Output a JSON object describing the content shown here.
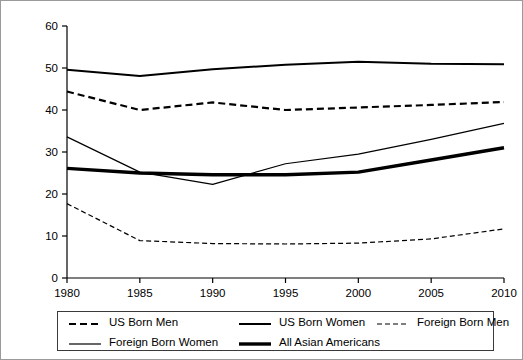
{
  "chart_data": {
    "type": "line",
    "title": "",
    "subtitle": "",
    "xlabel": "",
    "ylabel": "",
    "categories": [
      1980,
      1985,
      1990,
      1995,
      2000,
      2005,
      2010
    ],
    "x_tick_labels": [
      "1980",
      "1985",
      "1990",
      "1995",
      "2000",
      "2005",
      "2010"
    ],
    "y_tick_labels": [
      "0",
      "10",
      "20",
      "30",
      "40",
      "50",
      "60"
    ],
    "y_ticks": [
      0,
      10,
      20,
      30,
      40,
      50,
      60
    ],
    "xlim": [
      1980,
      2010
    ],
    "ylim": [
      0,
      60
    ],
    "grid": false,
    "legend_position": "bottom",
    "series": [
      {
        "name": "US Born Men",
        "style": "dashed",
        "width": 2.2,
        "dash": "7,4",
        "color": "#000000",
        "values": [
          44.4,
          40.0,
          41.8,
          40.0,
          40.6,
          41.2,
          41.9
        ]
      },
      {
        "name": "US Born Women",
        "style": "solid",
        "width": 2.0,
        "dash": "",
        "color": "#000000",
        "values": [
          49.6,
          48.1,
          49.7,
          50.8,
          51.5,
          51.0,
          50.9
        ]
      },
      {
        "name": "Foreign Born Men",
        "style": "dashed",
        "width": 1.2,
        "dash": "5,3",
        "color": "#000000",
        "values": [
          17.7,
          8.9,
          8.2,
          8.1,
          8.3,
          9.3,
          11.7
        ]
      },
      {
        "name": "Foreign Born Women",
        "style": "solid",
        "width": 1.2,
        "dash": "",
        "color": "#000000",
        "values": [
          33.6,
          25.2,
          22.3,
          27.2,
          29.5,
          33.0,
          36.8
        ]
      },
      {
        "name": "All Asian Americans",
        "style": "solid",
        "width": 3.4,
        "dash": "",
        "color": "#000000",
        "values": [
          26.1,
          25.0,
          24.6,
          24.6,
          25.2,
          28.1,
          31.0
        ]
      }
    ]
  },
  "legend": {
    "items": [
      {
        "label": "US Born Men",
        "row": 0,
        "col": 0
      },
      {
        "label": "US Born Women",
        "row": 0,
        "col": 1
      },
      {
        "label": "Foreign Born Men",
        "row": 0,
        "col": 2
      },
      {
        "label": "Foreign Born Women",
        "row": 1,
        "col": 0
      },
      {
        "label": "All Asian Americans",
        "row": 1,
        "col": 1
      }
    ]
  },
  "colors": {
    "line": "#000000",
    "axis": "#000000",
    "frame": "#9a9a9a",
    "legend_border": "#3a3a3a",
    "background": "#ffffff"
  }
}
